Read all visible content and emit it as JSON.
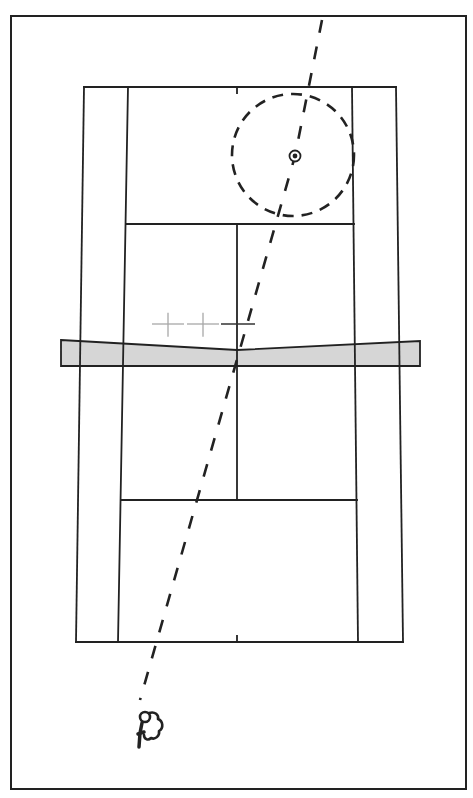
{
  "diagram": {
    "title": "Tennis shot trajectory diagram",
    "colors": {
      "background": "#ffffff",
      "line": "#222222",
      "net_fill": "#d6d6d6",
      "light_marker": "#a8a8a8",
      "dark_marker": "#333333"
    },
    "frame": {
      "x": 11,
      "y": 16,
      "w": 455,
      "h": 773
    },
    "court": {
      "far_baseline": {
        "y": 87,
        "doubles_left": 84,
        "doubles_right": 396,
        "singles_left": 128,
        "singles_right": 352
      },
      "near_baseline": {
        "y": 642,
        "doubles_left": 76,
        "doubles_right": 403,
        "singles_left": 118,
        "singles_right": 358
      },
      "far_service_line": {
        "y": 224,
        "x1": 126,
        "x2": 354
      },
      "near_service_line": {
        "y": 500,
        "x1": 121,
        "x2": 357
      },
      "center_service_line": {
        "x": 237,
        "y1": 224,
        "y2": 500
      },
      "center_mark_far": {
        "x": 237,
        "y1": 87,
        "y2": 93
      },
      "center_mark_near": {
        "x": 237,
        "y1": 636,
        "y2": 642
      }
    },
    "net": {
      "left": 61,
      "right": 420,
      "top_left": 340,
      "top_center": 350,
      "top_right": 341,
      "bottom": 366
    },
    "markers": [
      {
        "label": "position-marker-1",
        "x": 168,
        "y": 324,
        "size": 16,
        "shade": "light"
      },
      {
        "label": "position-marker-2",
        "x": 203,
        "y": 324,
        "size": 16,
        "shade": "light"
      },
      {
        "label": "position-marker-3",
        "x": 238,
        "y": 324,
        "size": 17,
        "shade": "dark"
      }
    ],
    "target": {
      "zone_center_x": 293,
      "zone_center_y": 155,
      "zone_radius": 61,
      "point_x": 295,
      "point_y": 156
    },
    "shot_path": {
      "style": "dashed",
      "points": [
        [
          322,
          20
        ],
        [
          295,
          156
        ],
        [
          140,
          700
        ]
      ]
    },
    "player": {
      "x": 148,
      "y": 735,
      "label": "player-figure"
    }
  }
}
